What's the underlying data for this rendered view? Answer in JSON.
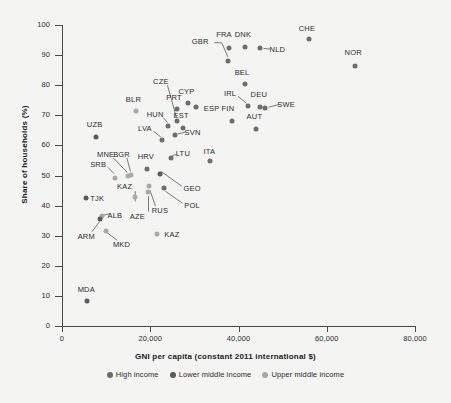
{
  "chart_data": {
    "type": "scatter",
    "title": "",
    "xlabel": "GNI per capita (constant 2011 international $)",
    "ylabel": "Share of households (%)",
    "xlim": [
      0,
      80000
    ],
    "ylim": [
      0,
      100
    ],
    "xticks": [
      "0",
      "20,000",
      "40,000",
      "60,000",
      "80,000"
    ],
    "xtick_values": [
      0,
      20000,
      40000,
      60000,
      80000
    ],
    "yticks": [
      "0",
      "10",
      "20",
      "30",
      "40",
      "50",
      "60",
      "70",
      "80",
      "90",
      "100"
    ],
    "ytick_values": [
      0,
      10,
      20,
      30,
      40,
      50,
      60,
      70,
      80,
      90,
      100
    ],
    "grid": false,
    "legend_position": "bottom",
    "legend": [
      {
        "label": "High income",
        "color": "#6d6d6d",
        "key": "high"
      },
      {
        "label": "Lower middle income",
        "color": "#5a5a5a",
        "key": "lower"
      },
      {
        "label": "Upper middle income",
        "color": "#a9a9a9",
        "key": "upper"
      }
    ],
    "points": [
      {
        "label": "CHE",
        "x": 56000,
        "y": 95.5,
        "group": "high",
        "lx": 55500,
        "ly": 99.0
      },
      {
        "label": "NOR",
        "x": 66500,
        "y": 86.5,
        "group": "high",
        "lx": 66000,
        "ly": 91.0
      },
      {
        "label": "DNK",
        "x": 41500,
        "y": 92.8,
        "group": "high",
        "lx": 41000,
        "ly": 97.0
      },
      {
        "label": "NLD",
        "x": 44800,
        "y": 92.2,
        "group": "high",
        "lx": 48800,
        "ly": 92.0
      },
      {
        "label": "FRA",
        "x": 37800,
        "y": 92.5,
        "group": "high",
        "lx": 36700,
        "ly": 97.0
      },
      {
        "label": "GBR",
        "x": 37600,
        "y": 88.2,
        "group": "high",
        "lx": 31300,
        "ly": 94.8
      },
      {
        "label": "BEL",
        "x": 41500,
        "y": 80.3,
        "group": "high",
        "lx": 40800,
        "ly": 84.5
      },
      {
        "label": "DEU",
        "x": 44800,
        "y": 72.6,
        "group": "high",
        "lx": 44600,
        "ly": 77.0
      },
      {
        "label": "SWE",
        "x": 46000,
        "y": 72.5,
        "group": "high",
        "lx": 50800,
        "ly": 73.8
      },
      {
        "label": "IRL",
        "x": 42200,
        "y": 73.2,
        "group": "high",
        "lx": 38100,
        "ly": 77.5
      },
      {
        "label": "AUT",
        "x": 44000,
        "y": 65.4,
        "group": "high",
        "lx": 43600,
        "ly": 69.8
      },
      {
        "label": "FIN",
        "x": 38500,
        "y": 68.0,
        "group": "high",
        "lx": 37600,
        "ly": 72.3
      },
      {
        "label": "ESP",
        "x": 30300,
        "y": 72.8,
        "group": "high",
        "lx": 33900,
        "ly": 72.4
      },
      {
        "label": "CYP",
        "x": 28600,
        "y": 74.1,
        "group": "high",
        "lx": 28200,
        "ly": 78.0
      },
      {
        "label": "PRT",
        "x": 26000,
        "y": 72.2,
        "group": "high",
        "lx": 25400,
        "ly": 76.2
      },
      {
        "label": "CZE",
        "x": 26000,
        "y": 68.2,
        "group": "high",
        "lx": 22400,
        "ly": 81.5
      },
      {
        "label": "EST",
        "x": 27400,
        "y": 65.7,
        "group": "high",
        "lx": 27000,
        "ly": 70.2
      },
      {
        "label": "SVN",
        "x": 25700,
        "y": 63.4,
        "group": "high",
        "lx": 29600,
        "ly": 64.6
      },
      {
        "label": "HUN",
        "x": 24000,
        "y": 66.5,
        "group": "high",
        "lx": 21100,
        "ly": 70.4
      },
      {
        "label": "LVA",
        "x": 22600,
        "y": 61.7,
        "group": "high",
        "lx": 18800,
        "ly": 65.8
      },
      {
        "label": "LTU",
        "x": 24600,
        "y": 55.8,
        "group": "high",
        "lx": 27400,
        "ly": 57.6
      },
      {
        "label": "ITA",
        "x": 33600,
        "y": 54.9,
        "group": "high",
        "lx": 33400,
        "ly": 58.0
      },
      {
        "label": "HRV",
        "x": 19300,
        "y": 52.1,
        "group": "high",
        "lx": 19000,
        "ly": 56.5
      },
      {
        "label": "POL",
        "x": 23200,
        "y": 46.0,
        "group": "high",
        "lx": 29500,
        "ly": 40.3
      },
      {
        "label": "BLR",
        "x": 16700,
        "y": 71.3,
        "group": "upper",
        "lx": 16200,
        "ly": 75.5
      },
      {
        "label": "UZB",
        "x": 7800,
        "y": 62.9,
        "group": "lower",
        "lx": 7400,
        "ly": 67.2
      },
      {
        "label": "MNE",
        "x": 15000,
        "y": 49.8,
        "group": "upper",
        "lx": 9900,
        "ly": 57.3
      },
      {
        "label": "BGR",
        "x": 15600,
        "y": 50.2,
        "group": "upper",
        "lx": 13500,
        "ly": 57.3
      },
      {
        "label": "SRB",
        "x": 12000,
        "y": 49.3,
        "group": "upper",
        "lx": 8200,
        "ly": 53.8
      },
      {
        "label": "GEO",
        "x": 22200,
        "y": 50.6,
        "group": "lower",
        "lx": 29500,
        "ly": 46.0
      },
      {
        "label": "RUS",
        "x": 19800,
        "y": 46.6,
        "group": "upper",
        "lx": 22200,
        "ly": 38.5
      },
      {
        "label": "KAZ",
        "x": 16600,
        "y": 42.7,
        "group": "upper",
        "lx": 14200,
        "ly": 46.4
      },
      {
        "label": "TJK",
        "x": 5500,
        "y": 42.4,
        "group": "lower",
        "lx": 8000,
        "ly": 42.6
      },
      {
        "label": "AZE",
        "x": 19600,
        "y": 44.4,
        "group": "upper",
        "lx": 17100,
        "ly": 36.4
      },
      {
        "label": "ALB",
        "x": 9100,
        "y": 36.6,
        "group": "upper",
        "lx": 12000,
        "ly": 37.0
      },
      {
        "label": "ARM",
        "x": 8600,
        "y": 35.4,
        "group": "lower",
        "lx": 5500,
        "ly": 29.8
      },
      {
        "label": "MKD",
        "x": 9900,
        "y": 31.4,
        "group": "upper",
        "lx": 13500,
        "ly": 27.3
      },
      {
        "label": "KAZ",
        "x": 21500,
        "y": 30.6,
        "group": "upper",
        "lx": 24900,
        "ly": 30.7
      },
      {
        "label": "MDA",
        "x": 5700,
        "y": 8.2,
        "group": "lower",
        "lx": 5500,
        "ly": 12.3
      }
    ],
    "leaders": [
      {
        "from_label": "GBR",
        "x1": 34500,
        "y1": 94.1,
        "x2": 36200,
        "y2": 94.1,
        "x3": 37600,
        "y3": 89.4
      },
      {
        "from_label": "NLD",
        "x1": 47200,
        "y1": 92.0,
        "x2": 45700,
        "y2": 92.2
      },
      {
        "from_label": "SWE",
        "x1": 49200,
        "y1": 73.6,
        "x2": 46800,
        "y2": 72.7
      },
      {
        "from_label": "IRL",
        "x1": 39900,
        "y1": 76.3,
        "x2": 41800,
        "y2": 74.0
      },
      {
        "from_label": "CZE",
        "x1": 23900,
        "y1": 80.0,
        "x2": 25900,
        "y2": 69.4
      },
      {
        "from_label": "HUN",
        "x1": 23000,
        "y1": 69.2,
        "x2": 23900,
        "y2": 67.6
      },
      {
        "from_label": "LVA",
        "x1": 20800,
        "y1": 64.6,
        "x2": 22400,
        "y2": 62.8
      },
      {
        "from_label": "SVN",
        "x1": 28000,
        "y1": 64.4,
        "x2": 26200,
        "y2": 63.8
      },
      {
        "from_label": "LTU",
        "x1": 26000,
        "y1": 57.0,
        "x2": 25000,
        "y2": 56.6
      },
      {
        "from_label": "MNE",
        "x1": 11600,
        "y1": 55.9,
        "x2": 14800,
        "y2": 51.0
      },
      {
        "from_label": "BGR",
        "x1": 14700,
        "y1": 55.9,
        "x2": 15500,
        "y2": 51.4
      },
      {
        "from_label": "SRB",
        "x1": 10400,
        "y1": 52.7,
        "x2": 11800,
        "y2": 50.6
      },
      {
        "from_label": "GEO",
        "x1": 27200,
        "y1": 46.4,
        "x2": 22500,
        "y2": 51.3
      },
      {
        "from_label": "RUS",
        "x1": 21200,
        "y1": 39.8,
        "x2": 19900,
        "y2": 45.2
      },
      {
        "from_label": "POL",
        "x1": 27300,
        "y1": 40.8,
        "x2": 23400,
        "y2": 44.8
      },
      {
        "from_label": "KAZ",
        "x1": 16600,
        "y1": 44.8,
        "x2": 16600,
        "y2": 41.4
      },
      {
        "from_label": "AZE",
        "x1": 19600,
        "y1": 38.0,
        "x2": 19600,
        "y2": 43.2
      },
      {
        "from_label": "ALB",
        "x1": 10800,
        "y1": 37.3,
        "x2": 9400,
        "y2": 36.8
      },
      {
        "from_label": "ARM",
        "x1": 6800,
        "y1": 31.3,
        "x2": 8500,
        "y2": 34.7
      },
      {
        "from_label": "MKD",
        "x1": 12500,
        "y1": 28.5,
        "x2": 10100,
        "y2": 31.1
      }
    ]
  }
}
